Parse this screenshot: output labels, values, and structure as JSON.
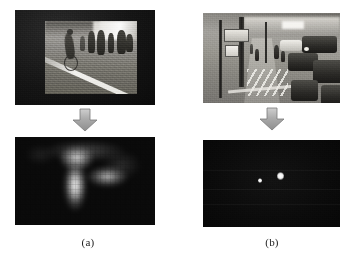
{
  "figure": {
    "background_color": "#ffffff",
    "width": 360,
    "height": 260,
    "columns": [
      {
        "id": "a",
        "caption": "(a)",
        "input": {
          "name": "pedestrian-crossing-frame",
          "description": "Grayscale surveillance frame of a cyclist and pedestrians crossing a road with a white lane marking, letterboxed inside a black matte border",
          "frame_color": "#101010",
          "scene_tone": "#8a8a86"
        },
        "arrow": {
          "direction": "down",
          "fill_color": "#a8a8a8",
          "edge_color": "#7d7d7d"
        },
        "output": {
          "name": "saliency-heatmap-blurred",
          "description": "Blurred low-resolution grayscale saliency map with a bright vertical blob at left-of-center and a fainter horizontal blob to its right on a near-black background",
          "background_color": "#0a0a0a",
          "peak_color": "#ffffff"
        }
      },
      {
        "id": "b",
        "caption": "(b)",
        "input": {
          "name": "busy-street-frame",
          "description": "Grayscale street scene with signposts and poles on the left, pedestrians on a pale central pavement with zig-zag road markings, and dense traffic on the right",
          "frame_color": "#ffffff",
          "scene_tone": "#8d8b86"
        },
        "arrow": {
          "direction": "down",
          "fill_color": "#a8a8a8",
          "edge_color": "#7d7d7d"
        },
        "output": {
          "name": "sparse-detection-map",
          "description": "Near-black noisy response map containing two small bright white blobs near the center",
          "background_color": "#0a0a0a",
          "peak_color": "#ffffff",
          "blob_count": 2
        }
      }
    ]
  }
}
